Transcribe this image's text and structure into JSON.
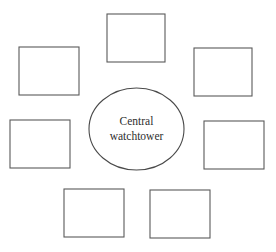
{
  "diagram": {
    "background_color": "#ffffff",
    "canvas": {
      "width": 276,
      "height": 252
    },
    "hub": {
      "name": "central-watchtower",
      "label_line1": "Central",
      "label_line2": "watchtower",
      "label_full": "Central watchtower",
      "shape": "ellipse",
      "cx": 136.5,
      "cy": 129,
      "rx": 47.5,
      "ry": 41,
      "stroke_color": "#4a4a4a",
      "fill_color": "#ffffff",
      "text_color": "#2e2e2e"
    },
    "cells": [
      {
        "name": "cell-top",
        "label": "",
        "x": 107,
        "y": 14,
        "width": 58,
        "height": 48
      },
      {
        "name": "cell-upper-left",
        "label": "",
        "x": 19,
        "y": 47,
        "width": 60,
        "height": 48
      },
      {
        "name": "cell-upper-right",
        "label": "",
        "x": 194,
        "y": 48,
        "width": 58,
        "height": 48
      },
      {
        "name": "cell-middle-left",
        "label": "",
        "x": 10,
        "y": 120,
        "width": 60,
        "height": 48
      },
      {
        "name": "cell-middle-right",
        "label": "",
        "x": 204,
        "y": 121,
        "width": 60,
        "height": 48
      },
      {
        "name": "cell-bottom-left",
        "label": "",
        "x": 64,
        "y": 189,
        "width": 60,
        "height": 48
      },
      {
        "name": "cell-bottom-right",
        "label": "",
        "x": 150,
        "y": 190,
        "width": 60,
        "height": 48
      }
    ],
    "cell_style": {
      "stroke_color": "#5a5a5a",
      "fill_color": "#ffffff",
      "stroke_width": 1.1
    }
  }
}
